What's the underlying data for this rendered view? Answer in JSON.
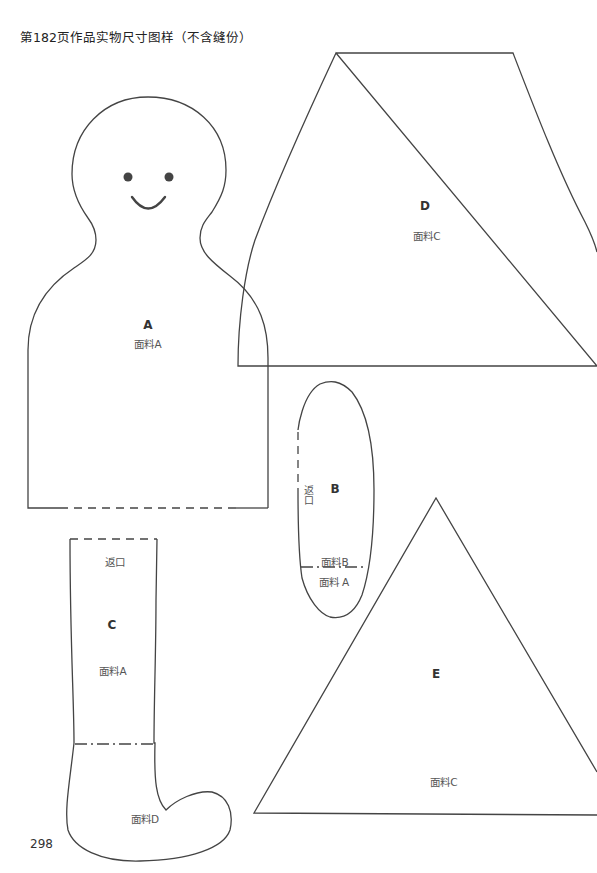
{
  "page": {
    "title": "第182页作品实物尺寸图样（不含缝份）",
    "page_number": "298",
    "line_color": "#444444"
  },
  "pieces": {
    "A": {
      "letter": "A",
      "fabric": "面料A"
    },
    "B": {
      "letter": "B",
      "fabric_top": "面料B",
      "fabric_bottom": "面料 A",
      "opening": "返口"
    },
    "C": {
      "letter": "C",
      "fabric_top": "面料A",
      "fabric_bottom": "面料D",
      "opening": "返口"
    },
    "D": {
      "letter": "D",
      "fabric": "面料C"
    },
    "E": {
      "letter": "E",
      "fabric": "面料C"
    }
  }
}
